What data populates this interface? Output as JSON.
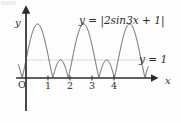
{
  "figure": {
    "width": 181,
    "height": 123,
    "background_color": "#fdfdfd",
    "ink_color": "#2b2b2b",
    "curve_color": "#555555",
    "gridline_color": "#c9c9c9",
    "corner_artifact": "partial-text-fragment"
  },
  "labels": {
    "curve_equation": "y = |2sin3x + 1|",
    "horizontal_line_equation": "y = 1",
    "y_axis": "y",
    "x_axis": "x",
    "origin": "O"
  },
  "axes": {
    "x_ticks": [
      "1",
      "2",
      "3",
      "4"
    ],
    "x_tick_values": [
      1,
      2,
      3,
      4
    ],
    "y_ticks": [],
    "x_axis_arrow": true,
    "y_axis_arrow": true,
    "origin_px": {
      "x": 26,
      "y": 78
    },
    "px_per_x_unit": 22,
    "px_per_y_unit": 18
  },
  "chart_data": {
    "type": "line",
    "title": "",
    "xlabel": "x",
    "ylabel": "y",
    "xlim": [
      -0.45,
      5.6
    ],
    "ylim": [
      -0.4,
      3.4
    ],
    "grid": false,
    "legend_position": "inline-annotation",
    "series": [
      {
        "name": "y = |2sin3x + 1|",
        "expression": "abs(2*sin(3*x) + 1)",
        "amplitude": 2,
        "frequency": 3,
        "vertical_shift": 1,
        "period": 2.0944,
        "max_value": 3,
        "min_value": 0,
        "secondary_peak_value": 1,
        "color": "#555555",
        "x_start": -0.35,
        "x_end": 5.55,
        "samples": 1400
      },
      {
        "name": "y = 1",
        "type": "horizontal-line",
        "y_value": 1,
        "color": "#c9c9c9",
        "x_start": 0,
        "x_end": 5.55
      }
    ],
    "annotations": [
      {
        "text": "y = |2sin3x + 1|",
        "x_px": 79,
        "y_px": 15
      },
      {
        "text": "y = 1",
        "x_px": 139,
        "y_px": 54
      }
    ]
  }
}
